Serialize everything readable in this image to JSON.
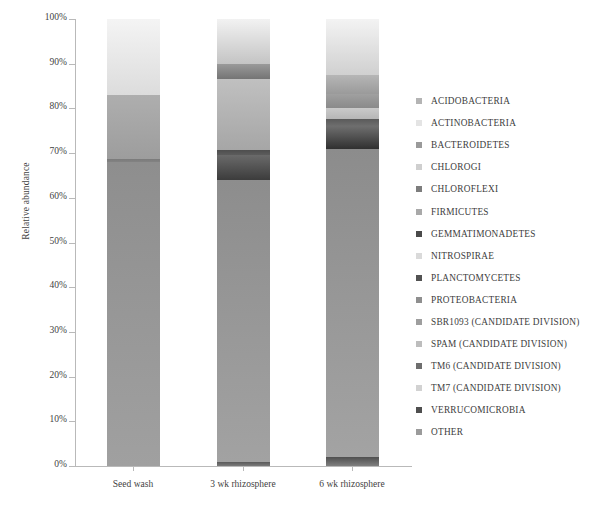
{
  "chart_data": {
    "type": "bar",
    "subtype": "stacked-bar-100pct",
    "title": "",
    "xlabel": "",
    "ylabel": "Relative abundance",
    "ylim": [
      0,
      100
    ],
    "yticks": [
      "0%",
      "10%",
      "20%",
      "30%",
      "40%",
      "50%",
      "60%",
      "70%",
      "80%",
      "90%",
      "100%"
    ],
    "ytick_values": [
      0,
      10,
      20,
      30,
      40,
      50,
      60,
      70,
      80,
      90,
      100
    ],
    "grid": false,
    "legend_position": "right",
    "categories": [
      "Seed wash",
      "3 wk rhizosphere",
      "6 wk rhizosphere"
    ],
    "series": [
      {
        "name": "ACIDOBACTERIA",
        "color": "#b4b4b4",
        "values": [
          0.0,
          1.0,
          2.0
        ]
      },
      {
        "name": "ACTINOBACTERIA",
        "color": "#e2e2e2",
        "values": [
          0.0,
          0.0,
          0.0
        ]
      },
      {
        "name": "BACTEROIDETES",
        "color": "#9a9a9a",
        "values": [
          68.0,
          63.0,
          69.0
        ]
      },
      {
        "name": "CHLOROGI",
        "color": "#cccccc",
        "values": [
          0.0,
          0.0,
          0.0
        ]
      },
      {
        "name": "CHLOROFLEXI",
        "color": "#787878",
        "values": [
          0.5,
          0.0,
          0.0
        ]
      },
      {
        "name": "FIRMICUTES",
        "color": "#a5a5a5",
        "values": [
          0.0,
          0.0,
          0.0
        ]
      },
      {
        "name": "GEMMATIMONADETES",
        "color": "#4a4a4a",
        "values": [
          0.0,
          5.5,
          5.0
        ]
      },
      {
        "name": "NITROSPIRAE",
        "color": "#d8d8d8",
        "values": [
          0.0,
          0.0,
          0.0
        ]
      },
      {
        "name": "PLANCTOMYCETES",
        "color": "#555555",
        "values": [
          0.0,
          1.0,
          1.5
        ]
      },
      {
        "name": "PROTEOBACTERIA",
        "color": "#a8a8a8",
        "values": [
          14.5,
          16.0,
          2.5
        ]
      },
      {
        "name": "SBR1093 (CANDIDATE DIVISION)",
        "color": "#9e9e9e",
        "values": [
          0.0,
          0.0,
          3.0
        ]
      },
      {
        "name": "SPAM (CANDIDATE DIVISION)",
        "color": "#bcbcbc",
        "values": [
          0.0,
          0.0,
          0.0
        ]
      },
      {
        "name": "TM6 (CANDIDATE DIVISION)",
        "color": "#707070",
        "values": [
          0.0,
          3.5,
          7.0
        ]
      },
      {
        "name": "TM7 (CANDIDATE DIVISION)",
        "color": "#cfcfcf",
        "values": [
          0.0,
          0.0,
          0.0
        ]
      },
      {
        "name": "OTHER",
        "color": "#9b9b9b",
        "values": [
          17.0,
          10.0,
          10.0
        ]
      }
    ],
    "bars": [
      {
        "category": "Seed wash",
        "segments": [
          {
            "name": "BACTEROIDETES",
            "from": 0.0,
            "to": 68.0,
            "color_top": "#8e8e8e",
            "color_bottom": "#a0a0a0"
          },
          {
            "name": "CHLOROFLEXI",
            "from": 68.0,
            "to": 68.6,
            "color_top": "#7b7b7b",
            "color_bottom": "#828282"
          },
          {
            "name": "PROTEOBACTERIA",
            "from": 68.6,
            "to": 83.0,
            "color_top": "#aeaeae",
            "color_bottom": "#9d9d9d"
          },
          {
            "name": "OTHER",
            "from": 83.0,
            "to": 100.0,
            "color_top": "#f4f4f4",
            "color_bottom": "#dcdcdc"
          }
        ]
      },
      {
        "category": "3 wk rhizosphere",
        "segments": [
          {
            "name": "ACIDOBACTERIA",
            "from": 0.0,
            "to": 1.0,
            "color_top": "#5a5a5a",
            "color_bottom": "#7a7a7a"
          },
          {
            "name": "BACTEROIDETES",
            "from": 1.0,
            "to": 64.0,
            "color_top": "#8d8d8d",
            "color_bottom": "#a2a2a2"
          },
          {
            "name": "GEMMATIMONADETES",
            "from": 64.0,
            "to": 69.5,
            "color_top": "#6a6a6a",
            "color_bottom": "#3c3c3c"
          },
          {
            "name": "PLANCTOMYCETES",
            "from": 69.5,
            "to": 70.6,
            "color_top": "#4e4e4e",
            "color_bottom": "#5c5c5c"
          },
          {
            "name": "PROTEOBACTERIA",
            "from": 70.6,
            "to": 86.5,
            "color_top": "#c0c0c0",
            "color_bottom": "#a6a6a6"
          },
          {
            "name": "TM6 (CANDIDATE DIVISION)",
            "from": 86.5,
            "to": 90.0,
            "color_top": "#9a9a9a",
            "color_bottom": "#747474"
          },
          {
            "name": "OTHER",
            "from": 90.0,
            "to": 100.0,
            "color_top": "#f2f2f2",
            "color_bottom": "#c4c4c4"
          }
        ]
      },
      {
        "category": "6 wk rhizosphere",
        "segments": [
          {
            "name": "ACIDOBACTERIA",
            "from": 0.0,
            "to": 2.0,
            "color_top": "#4f4f4f",
            "color_bottom": "#808080"
          },
          {
            "name": "BACTEROIDETES",
            "from": 2.0,
            "to": 71.0,
            "color_top": "#8c8c8c",
            "color_bottom": "#a3a3a3"
          },
          {
            "name": "TM6 (CANDIDATE DIVISION)",
            "from": 71.0,
            "to": 76.0,
            "color_top": "#6f6f6f",
            "color_bottom": "#303030"
          },
          {
            "name": "PLANCTOMYCETES",
            "from": 76.0,
            "to": 77.6,
            "color_top": "#5a5a5a",
            "color_bottom": "#6e6e6e"
          },
          {
            "name": "PROTEOBACTERIA",
            "from": 77.6,
            "to": 80.0,
            "color_top": "#cacaca",
            "color_bottom": "#b6b6b6"
          },
          {
            "name": "SBR1093 (CANDIDATE DIVISION)",
            "from": 80.0,
            "to": 83.2,
            "color_top": "#a0a0a0",
            "color_bottom": "#8a8a8a"
          },
          {
            "name": "GEMMATIMONADETES",
            "from": 83.2,
            "to": 87.5,
            "color_top": "#b6b6b6",
            "color_bottom": "#9a9a9a"
          },
          {
            "name": "OTHER",
            "from": 87.5,
            "to": 100.0,
            "color_top": "#f3f3f3",
            "color_bottom": "#d0d0d0"
          }
        ]
      }
    ],
    "legend_entries": [
      {
        "label": "ACIDOBACTERIA",
        "color": "#b4b4b4"
      },
      {
        "label": "ACTINOBACTERIA",
        "color": "#e4e4e4"
      },
      {
        "label": "BACTEROIDETES",
        "color": "#9a9a9a"
      },
      {
        "label": "CHLOROGI",
        "color": "#cfcfcf"
      },
      {
        "label": "CHLOROFLEXI",
        "color": "#7d7d7d"
      },
      {
        "label": "FIRMICUTES",
        "color": "#a9a9a9"
      },
      {
        "label": "GEMMATIMONADETES",
        "color": "#4a4a4a"
      },
      {
        "label": "NITROSPIRAE",
        "color": "#dadada"
      },
      {
        "label": "PLANCTOMYCETES",
        "color": "#525252"
      },
      {
        "label": "PROTEOBACTERIA",
        "color": "#8f8f8f"
      },
      {
        "label": "SBR1093 (CANDIDATE DIVISION)",
        "color": "#9e9e9e"
      },
      {
        "label": "SPAM (CANDIDATE DIVISION)",
        "color": "#bdbdbd"
      },
      {
        "label": "TM6 (CANDIDATE DIVISION)",
        "color": "#6e6e6e"
      },
      {
        "label": "TM7 (CANDIDATE DIVISION)",
        "color": "#d2d2d2"
      },
      {
        "label": "VERRUCOMICROBIA",
        "color": "#4f4f4f"
      },
      {
        "label": "OTHER",
        "color": "#9b9b9b"
      }
    ]
  }
}
